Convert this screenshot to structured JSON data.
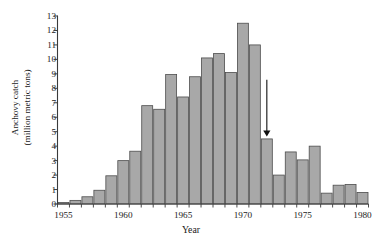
{
  "chart_data": {
    "type": "bar",
    "title": "",
    "xlabel": "Year",
    "ylabel": "Anchovy catch (million metric tons)",
    "ylabel_line1": "Anchovy catch",
    "ylabel_line2": "(million metric tons)",
    "ylim": [
      0,
      13
    ],
    "xlim": [
      1954.5,
      1981.5
    ],
    "ytick_values": [
      0,
      1,
      2,
      3,
      4,
      5,
      6,
      7,
      8,
      9,
      10,
      11,
      12,
      13
    ],
    "ytick_labels": [
      "0",
      "1",
      "2",
      "3",
      "4",
      "5",
      "6",
      "7",
      "8",
      "9",
      "10",
      "11",
      "12",
      "13"
    ],
    "xtick_values": [
      1955,
      1960,
      1965,
      1970,
      1975,
      1980
    ],
    "xtick_labels": [
      "1955",
      "1960",
      "1965",
      "1970",
      "1975",
      "1980"
    ],
    "grid": false,
    "categories": [
      1955,
      1956,
      1957,
      1958,
      1959,
      1960,
      1961,
      1962,
      1963,
      1964,
      1965,
      1966,
      1967,
      1968,
      1969,
      1970,
      1971,
      1972,
      1973,
      1974,
      1975,
      1976,
      1977,
      1978,
      1979,
      1980
    ],
    "values": [
      0.1,
      0.25,
      0.5,
      0.95,
      1.95,
      3.0,
      3.65,
      6.8,
      6.55,
      8.95,
      7.4,
      8.8,
      10.1,
      10.4,
      9.1,
      12.5,
      11.0,
      4.5,
      2.0,
      3.6,
      3.05,
      4.0,
      0.75,
      1.3,
      1.35,
      0.8
    ],
    "bar_color": "#a8a8a8",
    "bar_edge_color": "#4d4d4d",
    "axis_color": "#3a3a3a",
    "annotations": [
      {
        "type": "arrow",
        "name": "collapse-arrow",
        "at_year": 1972,
        "points_to_value": 4.5,
        "from_value": 8.6,
        "direction": "down"
      }
    ],
    "legend": null,
    "legend_position": "none"
  }
}
